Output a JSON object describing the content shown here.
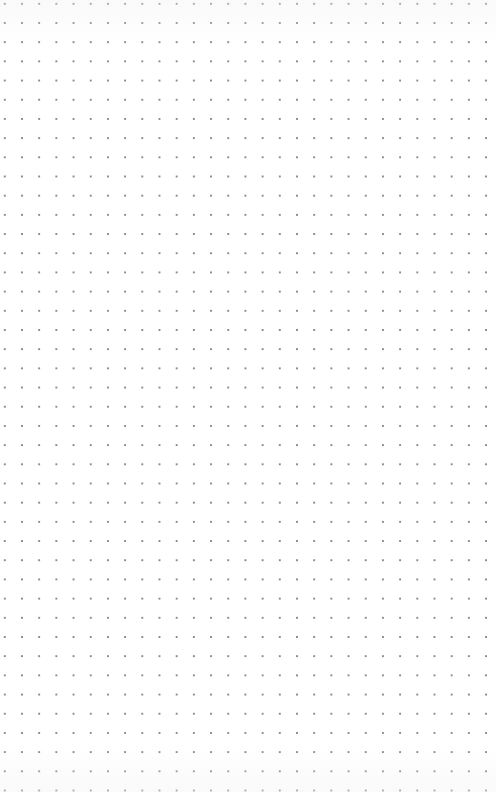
{
  "canvas": {
    "type": "dot-grid",
    "background_color": "#ffffff",
    "dot_color": "#8a8a8a",
    "dot_spacing_x": 17.2,
    "dot_spacing_y": 19.2,
    "columns": 27,
    "rows": 40
  }
}
